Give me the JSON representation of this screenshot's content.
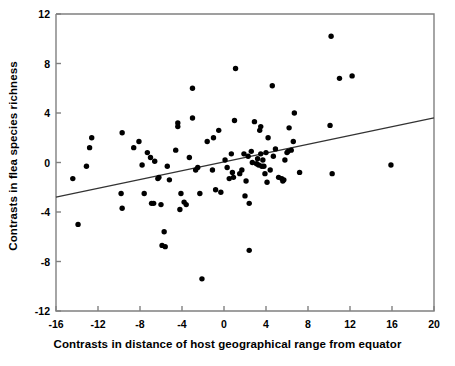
{
  "chart_data": {
    "type": "scatter",
    "title": "",
    "xlabel": "Contrasts in distance of host geographical range from equator",
    "ylabel": "Contrasts in flea species richness",
    "xlim": [
      -16,
      20
    ],
    "ylim": [
      -12,
      12
    ],
    "xticks": [
      -16,
      -12,
      -8,
      -4,
      0,
      4,
      8,
      12,
      16,
      20
    ],
    "xtick_labels": [
      "-16",
      "-12",
      "-8",
      "-4",
      "0",
      "4",
      "8",
      "12",
      "16",
      "20"
    ],
    "yticks": [
      -12,
      -8,
      -4,
      0,
      4,
      8,
      12
    ],
    "ytick_labels": [
      "-12",
      "-8",
      "-4",
      "0",
      "4",
      "8",
      "12"
    ],
    "grid": false,
    "legend": null,
    "marker": "filled-circle",
    "marker_color": "#000000",
    "axis_color": "#808080",
    "trendline": {
      "type": "linear-regression",
      "color": "#333333",
      "x": [
        -16,
        20
      ],
      "y": [
        -2.8,
        3.6
      ]
    },
    "points": [
      [
        -14.4,
        -1.3
      ],
      [
        -13.9,
        -5.0
      ],
      [
        -13.1,
        -0.3
      ],
      [
        -12.8,
        1.2
      ],
      [
        -12.6,
        2.0
      ],
      [
        -9.8,
        -2.5
      ],
      [
        -9.7,
        2.4
      ],
      [
        -9.7,
        -3.7
      ],
      [
        -8.6,
        1.2
      ],
      [
        -8.1,
        1.7
      ],
      [
        -7.8,
        -0.2
      ],
      [
        -7.6,
        -2.5
      ],
      [
        -7.3,
        0.8
      ],
      [
        -7.0,
        0.4
      ],
      [
        -6.9,
        -3.3
      ],
      [
        -6.7,
        -3.3
      ],
      [
        -6.6,
        0.1
      ],
      [
        -6.3,
        -1.3
      ],
      [
        -6.2,
        -1.2
      ],
      [
        -6.0,
        -3.4
      ],
      [
        -5.9,
        -6.7
      ],
      [
        -5.7,
        -5.6
      ],
      [
        -5.6,
        -6.8
      ],
      [
        -5.4,
        -0.3
      ],
      [
        -5.2,
        -1.4
      ],
      [
        -4.6,
        1.0
      ],
      [
        -4.4,
        2.9
      ],
      [
        -4.4,
        3.2
      ],
      [
        -4.2,
        -3.8
      ],
      [
        -4.1,
        -2.5
      ],
      [
        -3.8,
        -3.2
      ],
      [
        -3.6,
        -3.4
      ],
      [
        -3.3,
        0.4
      ],
      [
        -3.0,
        3.6
      ],
      [
        -3.0,
        6.0
      ],
      [
        -2.7,
        -0.6
      ],
      [
        -2.5,
        -0.4
      ],
      [
        -2.3,
        -2.5
      ],
      [
        -2.1,
        -9.4
      ],
      [
        -1.6,
        1.7
      ],
      [
        -1.1,
        -0.6
      ],
      [
        -1.0,
        2.0
      ],
      [
        -0.8,
        -2.2
      ],
      [
        -0.5,
        2.6
      ],
      [
        -0.3,
        -2.4
      ],
      [
        0.1,
        0.2
      ],
      [
        0.3,
        -0.4
      ],
      [
        0.5,
        -1.3
      ],
      [
        0.7,
        0.7
      ],
      [
        0.8,
        -0.8
      ],
      [
        0.9,
        -1.2
      ],
      [
        1.0,
        3.4
      ],
      [
        1.1,
        7.6
      ],
      [
        1.5,
        -0.9
      ],
      [
        1.7,
        -0.6
      ],
      [
        1.9,
        0.7
      ],
      [
        2.0,
        -2.7
      ],
      [
        2.1,
        -1.5
      ],
      [
        2.3,
        0.5
      ],
      [
        2.4,
        -7.1
      ],
      [
        2.4,
        -3.3
      ],
      [
        2.6,
        0.9
      ],
      [
        2.7,
        0.0
      ],
      [
        2.9,
        3.3
      ],
      [
        3.1,
        -0.1
      ],
      [
        3.2,
        0.3
      ],
      [
        3.3,
        -0.2
      ],
      [
        3.4,
        2.6
      ],
      [
        3.5,
        0.7
      ],
      [
        3.5,
        2.9
      ],
      [
        3.6,
        -0.3
      ],
      [
        3.7,
        0.2
      ],
      [
        3.8,
        -0.3
      ],
      [
        3.9,
        -0.9
      ],
      [
        4.0,
        0.8
      ],
      [
        4.1,
        -1.6
      ],
      [
        4.2,
        2.0
      ],
      [
        4.4,
        -0.6
      ],
      [
        4.6,
        6.2
      ],
      [
        4.7,
        0.5
      ],
      [
        4.9,
        1.1
      ],
      [
        5.2,
        -1.2
      ],
      [
        5.5,
        -1.3
      ],
      [
        5.6,
        -1.5
      ],
      [
        5.7,
        -1.4
      ],
      [
        5.8,
        0.2
      ],
      [
        6.0,
        0.8
      ],
      [
        6.1,
        0.9
      ],
      [
        6.2,
        2.8
      ],
      [
        6.4,
        1.0
      ],
      [
        6.6,
        1.7
      ],
      [
        6.7,
        4.0
      ],
      [
        7.2,
        -0.8
      ],
      [
        10.1,
        3.0
      ],
      [
        10.2,
        10.2
      ],
      [
        10.3,
        -0.9
      ],
      [
        11.0,
        6.8
      ],
      [
        12.2,
        7.0
      ],
      [
        15.9,
        -0.2
      ]
    ]
  }
}
